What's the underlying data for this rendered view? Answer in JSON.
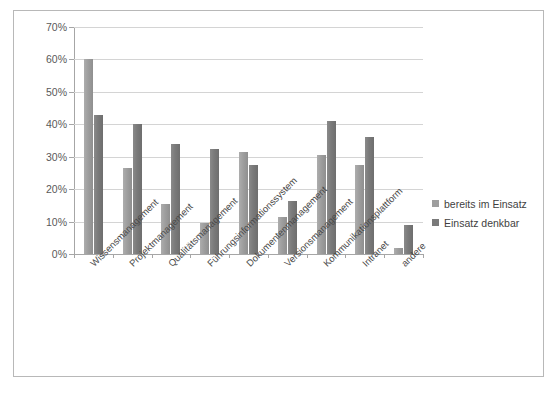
{
  "chart_data": {
    "type": "bar",
    "title": "",
    "xlabel": "",
    "ylabel": "",
    "ylim": [
      0,
      70
    ],
    "ytick_labels": [
      "0%",
      "10%",
      "20%",
      "30%",
      "40%",
      "50%",
      "60%",
      "70%"
    ],
    "ytick_values": [
      0,
      10,
      20,
      30,
      40,
      50,
      60,
      70
    ],
    "grid": true,
    "legend_position": "right",
    "categories": [
      "Wissensmanagement",
      "Projektmanagement",
      "Qualitätsmanagement",
      "Führungsinformationssystem",
      "Dokumentenmanagement",
      "Versionsmanagement",
      "Kommunikationsplattform",
      "Intranet",
      "andere"
    ],
    "series": [
      {
        "name": "bereits im Einsatz",
        "color": "#9e9e9e",
        "values": [
          60,
          26.5,
          15.5,
          9.5,
          31.5,
          11.5,
          30.5,
          27.5,
          2
        ]
      },
      {
        "name": "Einsatz denkbar",
        "color": "#7a7a7a",
        "values": [
          43,
          40,
          34,
          32.5,
          27.5,
          16.5,
          41,
          36,
          9
        ]
      }
    ]
  },
  "legend": {
    "items": [
      {
        "label": "bereits im Einsatz"
      },
      {
        "label": "Einsatz denkbar"
      }
    ]
  }
}
